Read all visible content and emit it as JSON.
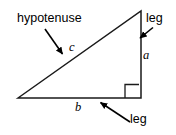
{
  "figure": {
    "background_color": "#ffffff",
    "stroke_color": "#000000",
    "text_color": "#000000"
  },
  "labels": {
    "hypotenuse": "hypotenuse",
    "leg_top": "leg",
    "leg_bottom": "leg",
    "side_c": "c",
    "side_a": "a",
    "side_b": "b"
  },
  "shape": {
    "type": "right-triangle",
    "vertices": {
      "left": [
        18,
        98
      ],
      "apex": [
        141,
        11
      ],
      "right_angle": [
        141,
        98
      ]
    },
    "right_angle_marker": {
      "x": 125,
      "y": 84,
      "size": 14
    },
    "sides": [
      {
        "name": "hypotenuse",
        "label": "c",
        "from": "left",
        "to": "apex"
      },
      {
        "name": "vertical-leg",
        "label": "a",
        "from": "apex",
        "to": "right_angle"
      },
      {
        "name": "horizontal-leg",
        "label": "b",
        "from": "left",
        "to": "right_angle"
      }
    ]
  },
  "annotations": [
    {
      "name": "hypotenuse-arrow",
      "from": [
        45,
        29
      ],
      "to": [
        63,
        55
      ]
    },
    {
      "name": "leg-top-arrow",
      "from": [
        153,
        28
      ],
      "to": [
        139,
        38
      ]
    },
    {
      "name": "leg-bottom-arrow",
      "from": [
        130,
        122
      ],
      "to": [
        100,
        102
      ]
    }
  ]
}
